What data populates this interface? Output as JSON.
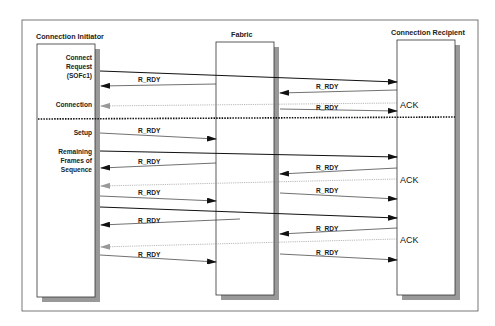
{
  "diagram": {
    "participants": [
      {
        "id": "initiator",
        "label": "Connection Initiator"
      },
      {
        "id": "fabric",
        "label": "Fabric"
      },
      {
        "id": "recipient",
        "label": "Connection Recipient"
      }
    ],
    "side_labels": {
      "connect_request": [
        "Connect",
        "Request",
        "(SOFc1)"
      ],
      "connection": "Connection",
      "setup": "Setup",
      "remaining": [
        "Remaining",
        "Frames of",
        "Sequence"
      ]
    },
    "messages": {
      "r_rdy": "R_RDY",
      "ack": "ACK"
    },
    "ack_labels": [
      "ACK",
      "ACK",
      "ACK"
    ],
    "r_rdy_labels": [
      "R_RDY",
      "R_RDY",
      "R_RDY",
      "R_RDY",
      "R_RDY",
      "R_RDY",
      "R_RDY",
      "R_RDY",
      "R_RDY",
      "R_RDY"
    ],
    "colors": {
      "frame": "#555555",
      "line": "#222222",
      "shadow": "#999999",
      "ack_arrow": "#999999"
    }
  }
}
